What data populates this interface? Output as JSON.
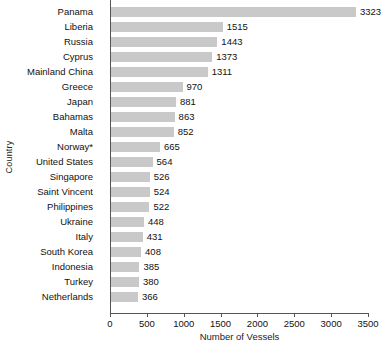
{
  "chart_data": {
    "type": "bar",
    "orientation": "horizontal",
    "title": "",
    "xlabel": "Number of Vessels",
    "ylabel": "Country",
    "xlim": [
      0,
      3500
    ],
    "xticks": [
      0,
      500,
      1000,
      1500,
      2000,
      2500,
      3000,
      3500
    ],
    "grid": false,
    "legend": null,
    "bar_color": "#c9c9c9",
    "axis_color": "#555555",
    "categories": [
      "Panama",
      "Liberia",
      "Russia",
      "Cyprus",
      "Mainland China",
      "Greece",
      "Japan",
      "Bahamas",
      "Malta",
      "Norway*",
      "United States",
      "Singapore",
      "Saint Vincent",
      "Philippines",
      "Ukraine",
      "Italy",
      "South Korea",
      "Indonesia",
      "Turkey",
      "Netherlands"
    ],
    "values": [
      3323,
      1515,
      1443,
      1373,
      1311,
      970,
      881,
      863,
      852,
      665,
      564,
      526,
      524,
      522,
      448,
      431,
      408,
      385,
      380,
      366
    ],
    "value_labels": [
      "3323",
      "1515",
      "1443",
      "1373",
      "1311",
      "970",
      "881",
      "863",
      "852",
      "665",
      "564",
      "526",
      "524",
      "522",
      "448",
      "431",
      "408",
      "385",
      "380",
      "366"
    ]
  }
}
